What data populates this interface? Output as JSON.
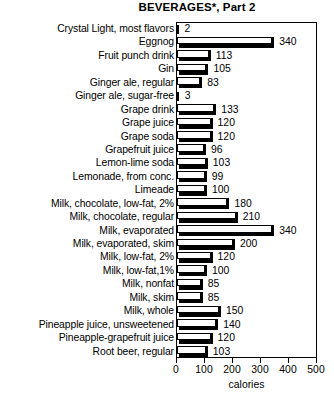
{
  "chart_data": {
    "type": "bar",
    "orientation": "horizontal",
    "title": "BEVERAGES*, Part 2",
    "xlabel": "calories",
    "ylabel": "",
    "xlim": [
      0,
      500
    ],
    "xticks": [
      0,
      100,
      200,
      300,
      400,
      500
    ],
    "grid": false,
    "legend": null,
    "categories": [
      "Crystal Light, most flavors",
      "Eggnog",
      "Fruit punch drink",
      "Gin",
      "Ginger ale, regular",
      "Ginger ale, sugar-free",
      "Grape drink",
      "Grape juice",
      "Grape soda",
      "Grapefruit juice",
      "Lemon-lime soda",
      "Lemonade, from conc.",
      "Limeade",
      "Milk, chocolate, low-fat, 2%",
      "Milk, chocolate, regular",
      "Milk, evaporated",
      "Milk, evaporated, skim",
      "Milk, low-fat, 2%",
      "Milk, low-fat,1%",
      "Milk, nonfat",
      "Milk, skim",
      "Milk, whole",
      "Pineapple juice, unsweetened",
      "Pineapple-grapefruit juice",
      "Root beer, regular"
    ],
    "values": [
      2,
      340,
      113,
      105,
      83,
      3,
      133,
      120,
      120,
      96,
      103,
      99,
      100,
      180,
      210,
      340,
      200,
      120,
      100,
      85,
      85,
      150,
      140,
      120,
      103
    ],
    "value_labels": [
      "2",
      "340",
      "113",
      "105",
      "83",
      "3",
      "133",
      "120",
      "120",
      "96",
      "103",
      "99",
      "100",
      "180",
      "210",
      "340",
      "200",
      "120",
      "100",
      "85",
      "85",
      "150",
      "140",
      "120",
      "103"
    ]
  },
  "colors": {
    "bar_face": "#ffffff",
    "bar_outline": "#000000",
    "bar_shadow": "#000000",
    "axis": "#000000",
    "background": "#ffffff",
    "text": "#000000"
  }
}
